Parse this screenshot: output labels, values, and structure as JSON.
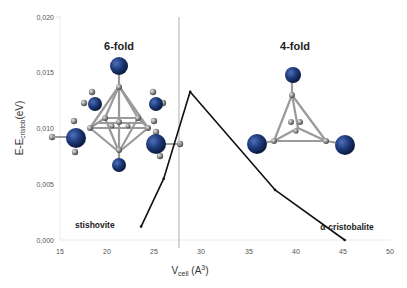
{
  "chart_data": {
    "type": "line",
    "title": "",
    "xlabel": "V_cell (A^3)",
    "ylabel": "E-E_cristob (eV)",
    "xlim": [
      15,
      50
    ],
    "ylim": [
      0,
      0.02
    ],
    "x_ticks": [
      "15",
      "20",
      "25",
      "30",
      "35",
      "40",
      "45",
      "50"
    ],
    "y_ticks": [
      "0,000",
      "0,005",
      "0,010",
      "0,015",
      "0,020"
    ],
    "grid": false,
    "series": [
      {
        "name": "energy",
        "x": [
          23.6,
          26.0,
          28.8,
          37.8,
          45.2
        ],
        "y": [
          0.0012,
          0.0055,
          0.0133,
          0.0045,
          0.0
        ]
      }
    ],
    "vertical_line_x": 27.6,
    "annotations": [
      {
        "text": "6-fold",
        "region": "left"
      },
      {
        "text": "4-fold",
        "region": "right"
      },
      {
        "text": "stishovite",
        "position": "bottom-left"
      },
      {
        "text": "α-cristobalite",
        "position": "bottom-right"
      }
    ]
  },
  "labels": {
    "six_fold": "6-fold",
    "four_fold": "4-fold",
    "stishovite": "stishovite",
    "cristobalite": "α-cristobalite",
    "xlabel_main": "V",
    "xlabel_sub": "cell",
    "xlabel_unit": " (A",
    "xlabel_sup": "3",
    "xlabel_close": ")",
    "ylabel_main": "E-E",
    "ylabel_sub": "cristob",
    "ylabel_unit": "(eV)"
  },
  "colors": {
    "atom_si": "#1c3a7a",
    "atom_o": "#8a8a8a",
    "line": "#111111",
    "divider": "#9a9a9a"
  }
}
